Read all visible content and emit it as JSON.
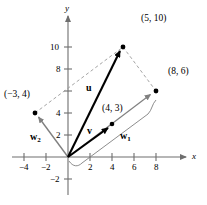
{
  "figure": {
    "axes": {
      "x_name": "x",
      "y_name": "y",
      "origin_px": [
        68,
        157
      ],
      "unit_px": 11.0,
      "xlim": [
        -5.2,
        9.6
      ],
      "ylim": [
        -3.1,
        12.2
      ],
      "x_ticks": [
        -4,
        -2,
        2,
        4,
        6,
        8
      ],
      "x_tick_labels": [
        "−4",
        "−2",
        "2",
        "4",
        "6",
        "8"
      ],
      "y_ticks": [
        -2,
        2,
        4,
        6,
        8,
        10
      ],
      "y_tick_labels": [
        "−2",
        "2",
        "4",
        "",
        "8",
        "10"
      ]
    },
    "points": [
      {
        "name": "u-tip",
        "coords": [
          5,
          10
        ],
        "label": "(5, 10)",
        "label_px": [
          141,
          14
        ]
      },
      {
        "name": "v-tip",
        "coords": [
          4,
          3
        ],
        "label": "(4, 3)",
        "label_px": [
          102,
          104
        ]
      },
      {
        "name": "w1-tip",
        "coords": [
          8,
          6
        ],
        "label": "(8, 6)",
        "label_px": [
          172,
          67
        ]
      },
      {
        "name": "w2-tip",
        "coords": [
          -3,
          4
        ],
        "label": "(−3, 4)",
        "label_px": [
          6,
          90
        ]
      }
    ],
    "vectors": [
      {
        "name": "u",
        "label": "u",
        "from": [
          0,
          0
        ],
        "to": [
          5,
          10
        ],
        "color": "#000000",
        "style": "solid-bold",
        "label_px": [
          86,
          83
        ]
      },
      {
        "name": "v",
        "label": "v",
        "from": [
          0,
          0
        ],
        "to": [
          4,
          3
        ],
        "color": "#000000",
        "style": "solid-bold",
        "label_px": [
          87,
          127
        ]
      },
      {
        "name": "w1",
        "label": "w",
        "sub": "1",
        "from": [
          0,
          0
        ],
        "to": [
          8,
          6
        ],
        "color": "#808080",
        "style": "solid-thin",
        "label_px": [
          122,
          132
        ]
      },
      {
        "name": "w2",
        "label": "w",
        "sub": "2",
        "from": [
          0,
          0
        ],
        "to": [
          -3,
          4
        ],
        "color": "#808080",
        "style": "solid-thin",
        "label_px": [
          35,
          133
        ]
      }
    ],
    "dashed_lines": [
      {
        "name": "w2-to-u",
        "from": [
          -3,
          4
        ],
        "to": [
          5,
          10
        ]
      },
      {
        "name": "u-to-w1",
        "from": [
          5,
          10
        ],
        "to": [
          8,
          6
        ]
      }
    ],
    "brace": {
      "name": "w1-brace",
      "from": [
        0,
        0
      ],
      "to": [
        8,
        6
      ],
      "color": "#808080"
    },
    "colors": {
      "axis": "#6e6e6e",
      "dashed": "#9a9a9a",
      "gray_vector": "#808080",
      "black_vector": "#000000"
    }
  }
}
